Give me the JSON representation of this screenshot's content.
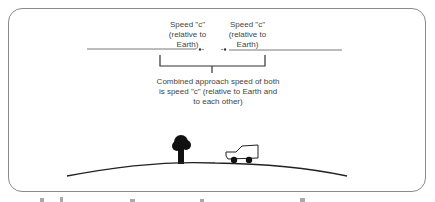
{
  "diagram": {
    "left_label": [
      "Speed \"c\"",
      "(relative to",
      "Earth)"
    ],
    "right_label": [
      "Speed \"c\"",
      "(relative to",
      "Earth)"
    ],
    "combined_label": [
      "Combined approach speed of both",
      "is speed \"c\" (relative to Earth and",
      "to each other)"
    ],
    "elements": [
      "left-beam-line",
      "right-beam-line",
      "brace",
      "tree-icon",
      "car-icon",
      "hill-ground"
    ]
  }
}
